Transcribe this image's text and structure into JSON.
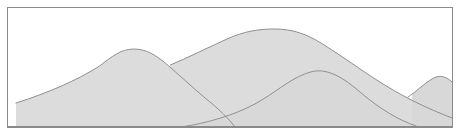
{
  "figure": {
    "kind": "line-drawing",
    "caption": "",
    "frame": {
      "x": 7,
      "y": 7,
      "width": 446,
      "height": 121,
      "border_color": "#8a8a8a",
      "border_width": 1,
      "background_color": "#ffffff"
    },
    "palette": {
      "background": "#ffffff",
      "hill_fill": "#dcdcdc",
      "hill_fill_front": "#d8d8d8",
      "outline": "#8f8f8f",
      "frame_border": "#8a8a8a",
      "baseline": "#8a8a8a"
    },
    "canvas_size": {
      "width": 461,
      "height": 136
    },
    "baseline_y": 119,
    "hills": [
      {
        "name": "hill-back-left",
        "label": "left background hill",
        "peak": {
          "x": 125,
          "y": 41
        },
        "left_base": {
          "x": 8,
          "y": 95
        },
        "right_base": {
          "x": 228,
          "y": 119
        },
        "path": "M 8 119 L 8 95 C 40 85 70 72 92 58 C 105 48 113 41.5 126 41 C 139 41 148 47 158 55 C 172 67 186 80 198 90 C 212 101 222 111 228 119 Z"
      },
      {
        "name": "hill-back-main",
        "label": "tall central background hill",
        "peak": {
          "x": 268,
          "y": 21
        },
        "left_base": {
          "x": 163,
          "y": 57
        },
        "right_base": {
          "x": 446,
          "y": 119
        },
        "path": "M 163 57 C 180 50 200 40 220 31 C 238 23 252 21 268 21 C 286 21 300 26 316 36 C 340 51 360 66 380 78 C 400 90 420 100 446 110 L 446 119 L 163 119 Z"
      },
      {
        "name": "hill-front-center",
        "label": "foreground rolling hill",
        "peak": {
          "x": 312,
          "y": 63
        },
        "left_base": {
          "x": 174,
          "y": 119
        },
        "right_base": {
          "x": 446,
          "y": 119
        },
        "path": "M 174 119 C 200 115 225 108 248 96 C 268 85 282 72 298 66 C 306 63 310 62.5 316 63 C 330 65 342 74 356 86 C 374 101 392 112 410 118 C 418 120 430 119 446 116 L 446 119 L 174 119 Z"
      },
      {
        "name": "hill-front-right",
        "label": "small right hill",
        "peak": {
          "x": 433,
          "y": 69
        },
        "left_base": {
          "x": 408,
          "y": 84
        },
        "right_base": {
          "x": 446,
          "y": 80
        },
        "path": "M 406 86 C 414 80 422 72 430 69 C 436 67 442 70 446 74 L 446 119 L 406 119 Z"
      }
    ],
    "outlines": [
      {
        "name": "ridge-back-left",
        "d": "M 8 95 C 40 85 70 72 92 58 C 105 48 113 41.5 126 41 C 139 41 148 47 158 55 C 172 67 186 80 198 90 C 212 101 222 111 228 119"
      },
      {
        "name": "ridge-back-main",
        "d": "M 163 57 C 180 50 200 40 220 31 C 238 23 252 21 268 21 C 286 21 300 26 316 36 C 340 51 360 66 380 78 C 400 90 420 100 446 110"
      },
      {
        "name": "ridge-front-center",
        "d": "M 174 119 C 200 115 225 108 248 96 C 268 85 282 72 298 66 C 306 63 310 62.5 316 63 C 330 65 342 74 356 86 C 374 101 392 112 410 118"
      },
      {
        "name": "ridge-front-right",
        "d": "M 402 89 C 412 82 422 72 430 69 C 436 67 442 70 446 74"
      }
    ]
  }
}
